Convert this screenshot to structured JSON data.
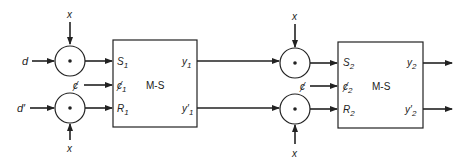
{
  "diagram": {
    "type": "block-diagram",
    "stage1": {
      "inputs": {
        "d": "d",
        "d_prime": "d′",
        "x_top": "x",
        "x_bottom": "x",
        "clock": "ȼ"
      },
      "box": {
        "title": "M-S",
        "ports_left": [
          {
            "base": "S",
            "sub": "1"
          },
          {
            "base": "ȼ",
            "sub": "1"
          },
          {
            "base": "R",
            "sub": "1"
          }
        ],
        "ports_right": [
          {
            "base": "y",
            "sub": "1"
          },
          {
            "base": "y′",
            "sub": "1"
          }
        ]
      }
    },
    "stage2": {
      "inputs": {
        "x_top": "x",
        "x_bottom": "x",
        "clock": "ȼ"
      },
      "box": {
        "title": "M-S",
        "ports_left": [
          {
            "base": "S",
            "sub": "2"
          },
          {
            "base": "ȼ",
            "sub": "2"
          },
          {
            "base": "R",
            "sub": "2"
          }
        ],
        "ports_right": [
          {
            "base": "y",
            "sub": "2"
          },
          {
            "base": "y′",
            "sub": "2"
          }
        ]
      }
    },
    "gate_symbol": "•"
  }
}
